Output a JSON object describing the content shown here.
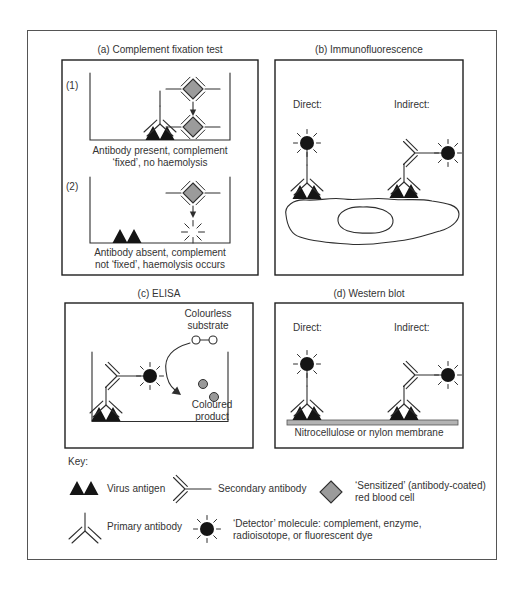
{
  "figure": {
    "panels": {
      "a": {
        "title": "(a) Complement fixation test",
        "sub1_label": "(1)",
        "sub2_label": "(2)",
        "caption1_line1": "Antibody present, complement",
        "caption1_line2": "‘fixed’, no haemolysis",
        "caption2_line1": "Antibody absent, complement",
        "caption2_line2": "not ‘fixed’, haemolysis occurs"
      },
      "b": {
        "title": "(b) Immunofluorescence",
        "direct_label": "Direct:",
        "indirect_label": "Indirect:"
      },
      "c": {
        "title": "(c) ELISA",
        "substrate_line1": "Colourless",
        "substrate_line2": "substrate",
        "product_line1": "Coloured",
        "product_line2": "product"
      },
      "d": {
        "title": "(d) Western blot",
        "direct_label": "Direct:",
        "indirect_label": "Indirect:",
        "membrane_label": "Nitrocellulose or nylon membrane"
      }
    },
    "key": {
      "title": "Key:",
      "items": [
        {
          "icon": "virus-antigen-icon",
          "label": "Virus antigen"
        },
        {
          "icon": "secondary-antibody-icon",
          "label": "Secondary antibody"
        },
        {
          "icon": "sensitized-rbc-icon",
          "label_line1": "‘Sensitized’ (antibody-coated)",
          "label_line2": "red blood cell"
        },
        {
          "icon": "primary-antibody-icon",
          "label": "Primary antibody"
        },
        {
          "icon": "detector-molecule-icon",
          "label_line1": "‘Detector’ molecule: complement, enzyme,",
          "label_line2": "radioisotope, or fluorescent dye"
        }
      ]
    },
    "colors": {
      "ink": "#2e2e2e",
      "text": "#333333",
      "rbc_fill": "#9b9b9b",
      "nucleus_fill": "#c9c9c9",
      "membrane_fill": "#b3b3b3",
      "product_fill": "#999999",
      "detector_fill": "#151515",
      "antigen_fill": "#151515",
      "frame_border": "#555555",
      "panel_border": "#1f1f1f"
    }
  }
}
